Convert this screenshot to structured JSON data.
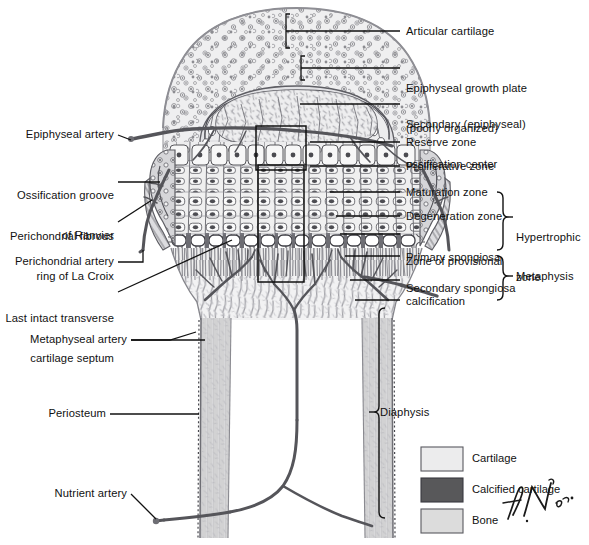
{
  "figure": {
    "signature": "f. N. m.d."
  },
  "labels_right": [
    {
      "id": "articular-cartilage",
      "text": "Articular cartilage",
      "lines": [
        "Articular cartilage"
      ]
    },
    {
      "id": "epiphyseal-growth-plate",
      "text": "Epiphyseal growth plate (poorly organized)",
      "lines": [
        "Epiphyseal growth plate",
        "(poorly organized)"
      ]
    },
    {
      "id": "secondary-ossification-center",
      "text": "Secondary (epiphyseal) ossification center",
      "lines": [
        "Secondary (epiphyseal)",
        "ossification center"
      ]
    },
    {
      "id": "reserve-zone",
      "text": "Reserve zone",
      "lines": [
        "Reserve zone"
      ]
    },
    {
      "id": "proliferative-zone",
      "text": "Proliferative zone",
      "lines": [
        "Proliferative zone"
      ]
    },
    {
      "id": "maturation-zone",
      "text": "Maturation zone",
      "lines": [
        "Maturation zone"
      ]
    },
    {
      "id": "degeneration-zone",
      "text": "Degeneration zone",
      "lines": [
        "Degeneration zone"
      ]
    },
    {
      "id": "zone-of-provisional-calcification",
      "text": "Zone of provisional calcification",
      "lines": [
        "Zone of provisional",
        "calcification"
      ]
    },
    {
      "id": "primary-spongiosa",
      "text": "Primary spongiosa",
      "lines": [
        "Primary spongiosa"
      ]
    },
    {
      "id": "secondary-spongiosa",
      "text": "Secondary spongiosa",
      "lines": [
        "Secondary spongiosa"
      ]
    }
  ],
  "brackets_right": [
    {
      "id": "hypertrophic-zone",
      "text": "Hypertrophic zone",
      "lines": [
        "Hypertrophic",
        "zone"
      ]
    },
    {
      "id": "metaphysis",
      "text": "Metaphysis",
      "lines": [
        "Metaphysis"
      ]
    },
    {
      "id": "diaphysis",
      "text": "Diaphysis",
      "lines": [
        "Diaphysis"
      ]
    }
  ],
  "labels_left": [
    {
      "id": "epiphyseal-artery",
      "text": "Epiphyseal artery",
      "lines": [
        "Epiphyseal artery"
      ]
    },
    {
      "id": "ossification-groove-of-ranvier",
      "text": "Ossification groove of Ranvier",
      "lines": [
        "Ossification groove",
        "of Ranvier"
      ]
    },
    {
      "id": "perichondrial-fibrous-ring-of-la-croix",
      "text": "Perichondrial fibrous ring of La Croix",
      "lines": [
        "Perichondrial fibrous",
        "ring of La Croix"
      ]
    },
    {
      "id": "perichondrial-artery",
      "text": "Perichondrial artery",
      "lines": [
        "Perichondrial artery"
      ]
    },
    {
      "id": "last-intact-transverse-cartilage-septum",
      "text": "Last intact transverse cartilage septum",
      "lines": [
        "Last intact transverse",
        "cartilage septum"
      ]
    },
    {
      "id": "metaphyseal-artery",
      "text": "Metaphyseal artery",
      "lines": [
        "Metaphyseal artery"
      ]
    },
    {
      "id": "periosteum",
      "text": "Periosteum",
      "lines": [
        "Periosteum"
      ]
    },
    {
      "id": "nutrient-artery",
      "text": "Nutrient artery",
      "lines": [
        "Nutrient artery"
      ]
    }
  ],
  "legend": {
    "items": [
      {
        "id": "cartilage",
        "label": "Cartilage",
        "color": "#ececed"
      },
      {
        "id": "calcified-cartilage",
        "label": "Calcified cartilage",
        "color": "#58585a"
      },
      {
        "id": "bone",
        "label": "Bone",
        "color": "#dcdcdc"
      }
    ]
  },
  "colors": {
    "ink": "#111111",
    "leader": "#1a1a1a",
    "cartilage": "#ececed",
    "calcified_cartilage": "#58585a",
    "bone": "#dcdcdc",
    "vessel": "#555558",
    "background": "#ffffff"
  }
}
